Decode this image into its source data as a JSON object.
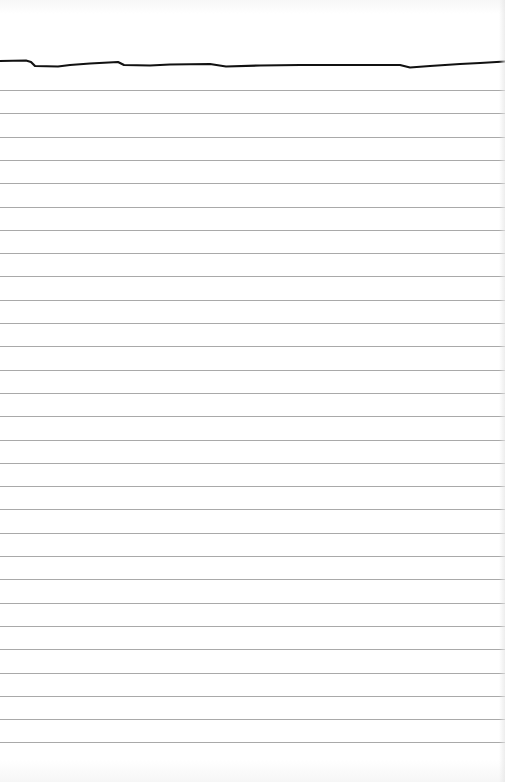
{
  "page": {
    "type": "lined-paper",
    "background_color": "#ffffff",
    "rule_color": "#a9a9a9",
    "header_line_color": "#111111",
    "rule_start_y": 90,
    "rule_spacing": 23.3,
    "rule_count": 29
  }
}
